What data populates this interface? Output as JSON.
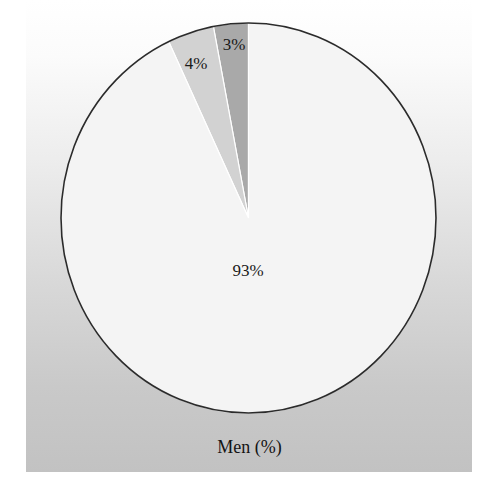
{
  "chart_data": {
    "type": "pie",
    "title": "Men (%)",
    "categories": [
      "Category A",
      "Category B",
      "Category C"
    ],
    "values": [
      93,
      4,
      3
    ],
    "labels": [
      "93%",
      "4%",
      "3%"
    ],
    "colors": [
      "#f4f4f4",
      "#d2d2d2",
      "#a9a9a9"
    ],
    "start_angle_deg": 0,
    "direction": "counterclockwise-from-top",
    "legend": "none",
    "grid": false
  },
  "chart": {
    "title": "Men (%)",
    "slices": [
      {
        "label": "93%",
        "value": 93,
        "color": "#f4f4f4"
      },
      {
        "label": "4%",
        "value": 4,
        "color": "#d2d2d2"
      },
      {
        "label": "3%",
        "value": 3,
        "color": "#a9a9a9"
      }
    ]
  }
}
